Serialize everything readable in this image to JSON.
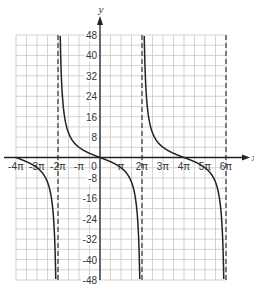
{
  "chart_data": {
    "type": "line",
    "title": "",
    "function": "y = -4 tan(x/4)",
    "xlabel": "x",
    "ylabel": "y",
    "xlim_pi": [
      -4,
      6
    ],
    "ylim": [
      -48,
      48
    ],
    "grid": true,
    "x_grid_step_pi": 0.5,
    "y_grid_step": 4,
    "x_tick_labels": [
      "-4π",
      "-3π",
      "-2π",
      "-π",
      "0",
      "π",
      "2π",
      "3π",
      "4π",
      "5π",
      "6π"
    ],
    "x_tick_values_pi": [
      -4,
      -3,
      -2,
      -1,
      0,
      1,
      2,
      3,
      4,
      5,
      6
    ],
    "y_tick_labels": [
      "48",
      "40",
      "32",
      "24",
      "16",
      "8",
      "-8",
      "-16",
      "-24",
      "-32",
      "-40",
      "-48"
    ],
    "y_tick_values": [
      48,
      40,
      32,
      24,
      16,
      8,
      -8,
      -16,
      -24,
      -32,
      -40,
      -48
    ],
    "asymptotes_pi": [
      -2,
      2,
      6
    ],
    "zeros_pi": [
      -4,
      0,
      4
    ],
    "sample_points": [
      {
        "x_pi": -4,
        "y": 0
      },
      {
        "x_pi": -3,
        "y": -4
      },
      {
        "x_pi": -1,
        "y": 4
      },
      {
        "x_pi": 0,
        "y": 0
      },
      {
        "x_pi": 1,
        "y": -4
      },
      {
        "x_pi": 3,
        "y": 4
      },
      {
        "x_pi": 4,
        "y": 0
      },
      {
        "x_pi": 5,
        "y": -4
      }
    ],
    "colors": {
      "grid": "#c8c8c8",
      "axis": "#222222",
      "curve": "#222222",
      "asymptote": "#333333"
    }
  }
}
